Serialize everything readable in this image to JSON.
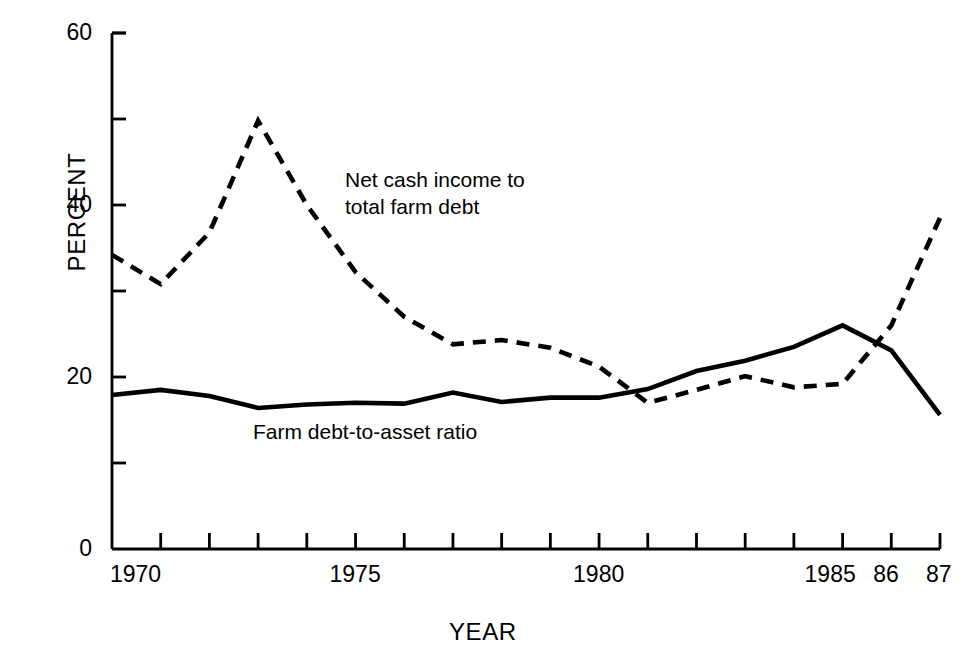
{
  "chart_data": {
    "type": "line",
    "title": "",
    "xlabel": "YEAR",
    "ylabel": "PERCENT",
    "ylim": [
      0,
      60
    ],
    "xlim": [
      1970,
      1987
    ],
    "grid": false,
    "legend_position": "inline-annotations",
    "y_ticks_major": [
      0,
      20,
      40,
      60
    ],
    "y_ticks_minor": [
      10,
      30,
      50
    ],
    "y_tick_labels": [
      "0",
      "20",
      "40",
      "60"
    ],
    "x_tick_values": [
      1970,
      1971,
      1972,
      1973,
      1974,
      1975,
      1976,
      1977,
      1978,
      1979,
      1980,
      1981,
      1982,
      1983,
      1984,
      1985,
      1986,
      1987
    ],
    "x_tick_labels_shown": [
      {
        "value": 1970,
        "label": "1970"
      },
      {
        "value": 1975,
        "label": "1975"
      },
      {
        "value": 1980,
        "label": "1980"
      },
      {
        "value": 1985,
        "label": "1985"
      },
      {
        "value": 1986,
        "label": "86"
      },
      {
        "value": 1987,
        "label": "87"
      }
    ],
    "x": [
      1970,
      1971,
      1972,
      1973,
      1974,
      1975,
      1976,
      1977,
      1978,
      1979,
      1980,
      1981,
      1982,
      1983,
      1984,
      1985,
      1986,
      1987
    ],
    "series": [
      {
        "name": "Net cash income to total farm debt",
        "style": "dashed",
        "color": "#000000",
        "values": [
          34.2,
          30.8,
          36.8,
          49.8,
          40.0,
          32.2,
          27.0,
          23.8,
          24.3,
          23.4,
          21.2,
          17.0,
          18.5,
          20.1,
          18.8,
          19.2,
          26.0,
          38.5
        ]
      },
      {
        "name": "Farm debt-to-asset ratio",
        "style": "solid",
        "color": "#000000",
        "values": [
          17.9,
          18.5,
          17.8,
          16.4,
          16.8,
          17.0,
          16.9,
          18.2,
          17.1,
          17.6,
          17.6,
          18.6,
          20.7,
          21.9,
          23.5,
          26.0,
          23.1,
          15.6
        ]
      }
    ],
    "annotations": [
      {
        "name": "dashed-series-label",
        "text_line1": "Net cash income to",
        "text_line2": "total farm debt"
      },
      {
        "name": "solid-series-label",
        "text": "Farm debt-to-asset ratio"
      }
    ]
  }
}
